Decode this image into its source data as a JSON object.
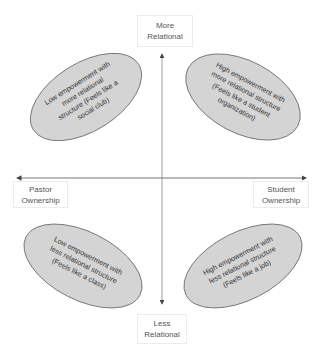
{
  "axes": {
    "top_label": "More\nRelational",
    "bottom_label": "Less\nRelational",
    "left_label": "Pastor\nOwnership",
    "right_label": "Student\nOwnership"
  },
  "quadrants": [
    {
      "position": "top-left",
      "text": "Low empowerment with\nmore relational\nstructure (Feels like a\nsocial club)"
    },
    {
      "position": "top-right",
      "text": "High empowerment with\nmore relational structure\n(Feels like a student\norganization)"
    },
    {
      "position": "bottom-left",
      "text": "Low empowerment with\nless relational structure\n(Feels like a class)"
    },
    {
      "position": "bottom-right",
      "text": "High empowerment with\nless relational structure\n(Feels like a job)"
    }
  ],
  "colors": {
    "ellipse_fill": "#d4d4d4",
    "ellipse_stroke": "#6a6a6a",
    "axis": "#555555"
  }
}
